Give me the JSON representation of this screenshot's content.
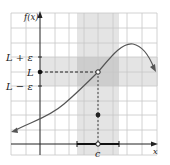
{
  "figure": {
    "type": "epsilon-delta limit diagram",
    "y_axis_label": "f(x)",
    "x_axis_label": "x",
    "y_labels": {
      "upper": "L + ε",
      "middle": "L",
      "lower": "L − ε"
    },
    "x_point_label": "c",
    "colors": {
      "grid": "#c8c8c8",
      "band_light": "#e6e6e6",
      "band_dark": "#cfcfcf",
      "curve": "#555555",
      "axis": "#222222"
    }
  }
}
